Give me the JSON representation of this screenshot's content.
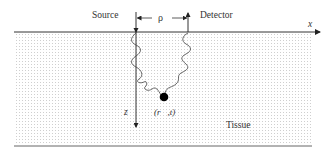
{
  "diagram": {
    "labels": {
      "source": "Source",
      "detector": "Detector",
      "separation": "ρ",
      "x_axis": "x",
      "z_axis": "z",
      "point": "(r⃗,t)",
      "medium": "Tissue"
    },
    "colors": {
      "line": "#333333",
      "dot": "#000000",
      "tissue_dots": "#bdbdbd",
      "background": "#ffffff"
    }
  }
}
